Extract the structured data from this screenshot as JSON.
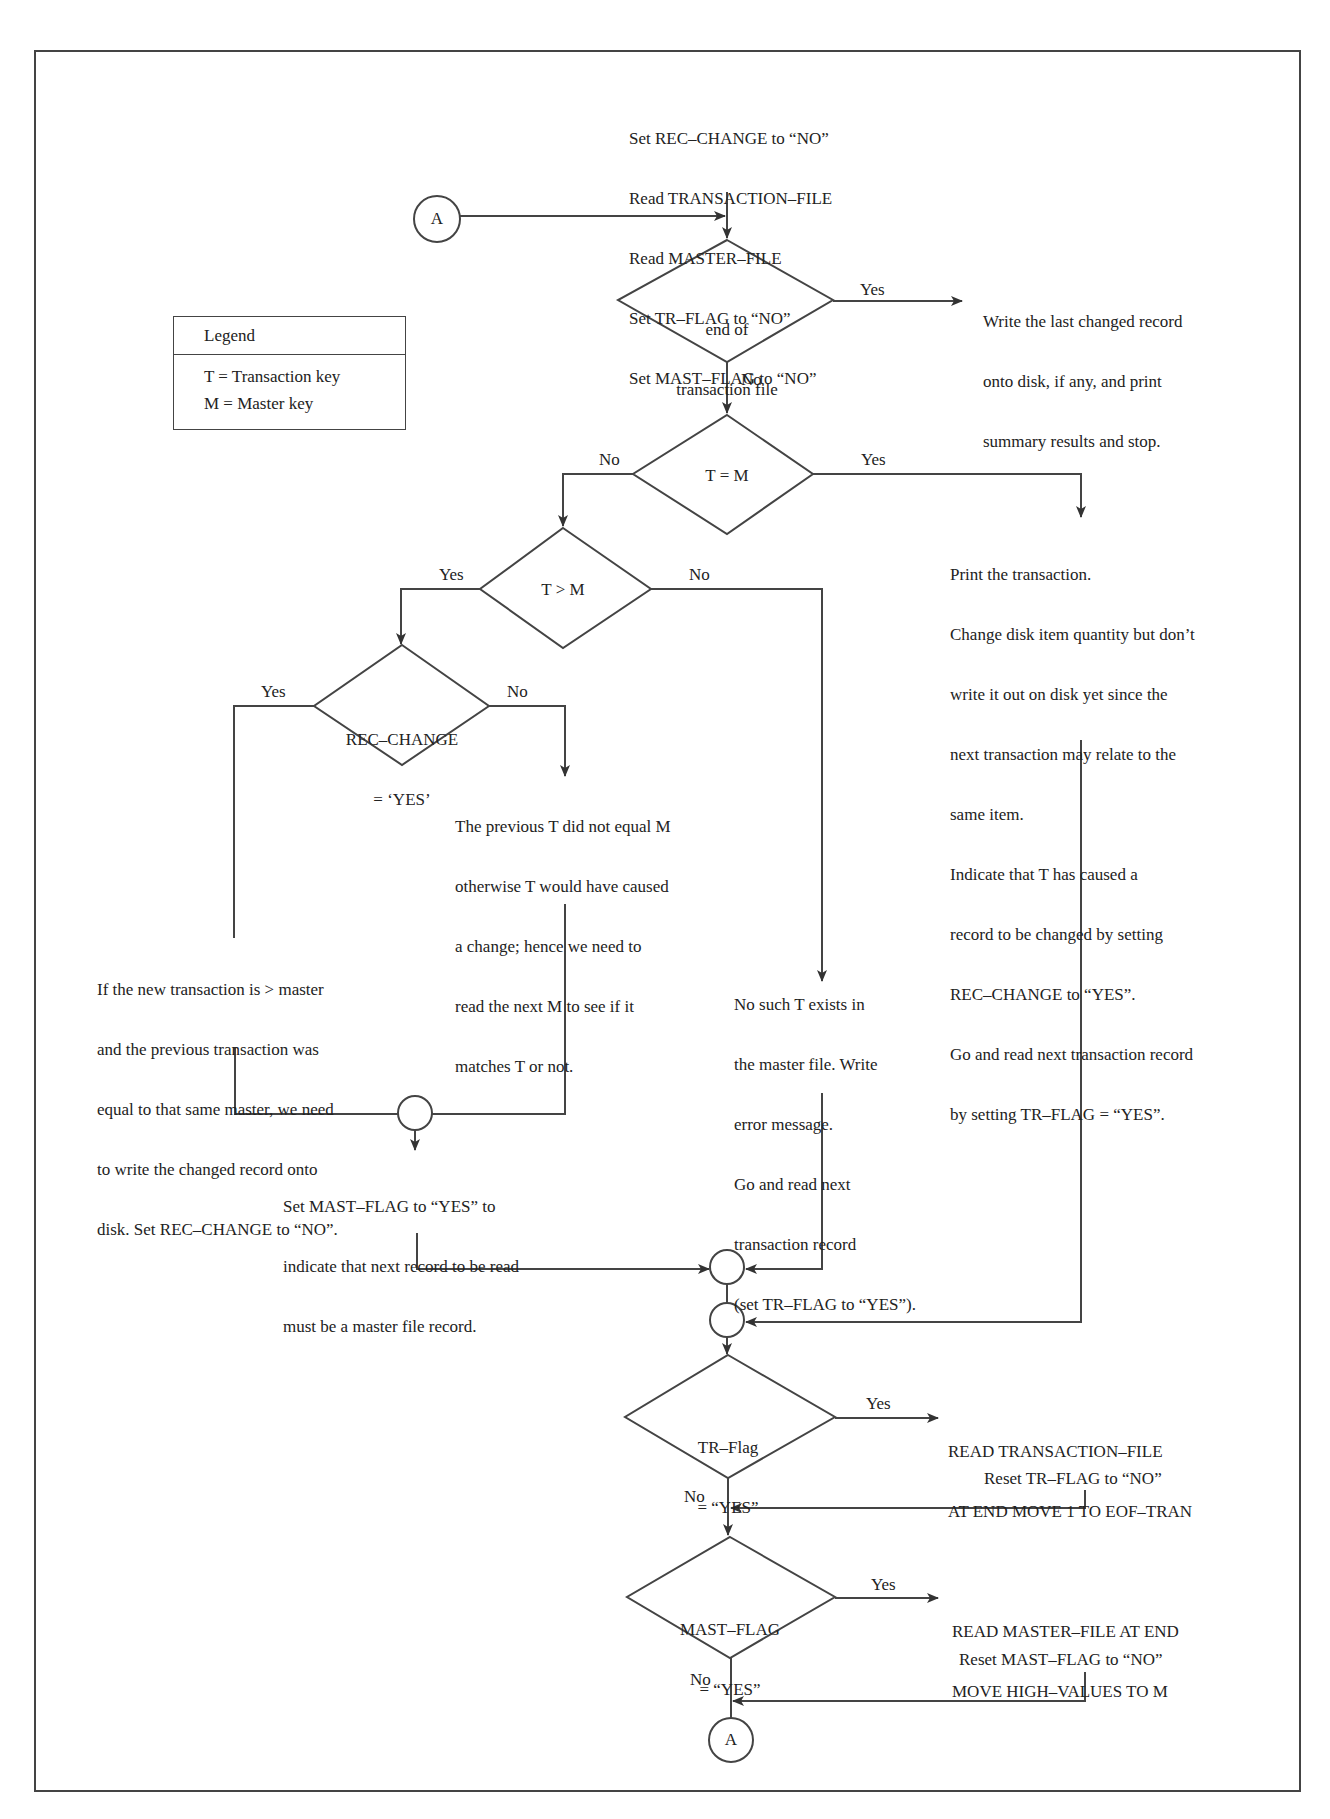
{
  "legend": {
    "title": "Legend",
    "items": [
      "T = Transaction key",
      "M = Master key"
    ]
  },
  "connectors": {
    "top": "A",
    "bottom": "A"
  },
  "init_block": [
    "Set REC–CHANGE to “NO”",
    "Read TRANSACTION–FILE",
    "Read MASTER–FILE",
    "Set TR–FLAG to “NO”",
    "Set MAST–FLAG to “NO”"
  ],
  "decisions": {
    "eof": {
      "lines": [
        "end of",
        "transaction file"
      ],
      "yes": "Yes",
      "no": "No"
    },
    "t_eq_m": {
      "lines": [
        "T = M"
      ],
      "yes": "Yes",
      "no": "No"
    },
    "t_gt_m": {
      "lines": [
        "T > M"
      ],
      "yes": "Yes",
      "no": "No"
    },
    "rec_change": {
      "lines": [
        "REC–CHANGE",
        "= ‘YES’"
      ],
      "yes": "Yes",
      "no": "No"
    },
    "tr_flag": {
      "lines": [
        "TR–Flag",
        "= “YES”"
      ],
      "yes": "Yes",
      "no": "No"
    },
    "mast_flag": {
      "lines": [
        "MAST–FLAG",
        "= “YES”"
      ],
      "yes": "Yes",
      "no": "No"
    }
  },
  "processes": {
    "eof_yes": [
      "Write the last changed record",
      "onto disk, if any, and print",
      "summary results and stop."
    ],
    "t_eq_m_yes": [
      "Print the transaction.",
      "Change disk item quantity but don’t",
      "write it out on disk yet since the",
      "next transaction may relate to the",
      "same item.",
      "Indicate that T has caused a",
      "record to be changed by setting",
      "REC–CHANGE to “YES”.",
      "Go and read next transaction record",
      "by setting TR–FLAG = “YES”."
    ],
    "rec_change_no": [
      "The previous T did not equal M",
      "otherwise T would have caused",
      "a change; hence we need to",
      "read the next M to see if it",
      "matches T or not."
    ],
    "rec_change_yes": [
      "If the new transaction is > master",
      "and the previous transaction was",
      "equal to that same master, we need",
      "to write the changed record onto",
      "disk. Set REC–CHANGE to “NO”."
    ],
    "t_gt_m_no": [
      "No such T exists in",
      "the master file. Write",
      "error message.",
      "Go and read next",
      "transaction record",
      "(set TR–FLAG to “YES”)."
    ],
    "set_mast_flag": [
      "Set MAST–FLAG to “YES” to",
      "indicate that next record to be read",
      "must be a master file record."
    ],
    "read_tran": [
      "READ TRANSACTION–FILE",
      "AT END MOVE 1 TO EOF–TRAN"
    ],
    "reset_tr": "Reset TR–FLAG to “NO”",
    "read_master": [
      "READ MASTER–FILE AT END",
      "MOVE HIGH–VALUES TO M"
    ],
    "reset_mast": "Reset MAST–FLAG to “NO”"
  },
  "colors": {
    "ink": "#222222",
    "line": "#444444",
    "background": "#ffffff"
  }
}
